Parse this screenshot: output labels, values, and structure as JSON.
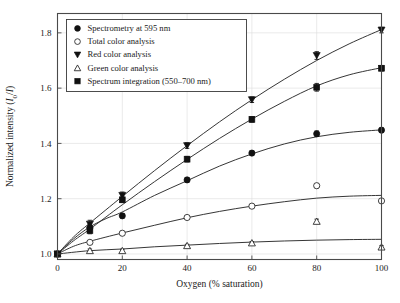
{
  "chart_data": {
    "type": "line",
    "title": "",
    "xlabel": "Oxygen (% saturation)",
    "ylabel": "Normalized intensity (I0/I)",
    "ylabel_parts": {
      "main": "Normalized intensity (",
      "i0": "I",
      "sub0": "0",
      "slash": "/",
      "i": "I",
      "close": ")"
    },
    "x": [
      0,
      10,
      20,
      40,
      60,
      80,
      100
    ],
    "xlim": [
      0,
      100
    ],
    "ylim": [
      0.98,
      1.87
    ],
    "xticks": [
      0,
      20,
      40,
      60,
      80,
      100
    ],
    "xtick_labels": [
      "0",
      "20",
      "40",
      "60",
      "80",
      "100"
    ],
    "yticks": [
      1.0,
      1.2,
      1.4,
      1.6,
      1.8
    ],
    "ytick_labels": [
      "1.0",
      "1.2",
      "1.4",
      "1.6",
      "1.8"
    ],
    "grid": true,
    "legend_position": "upper-left",
    "series": [
      {
        "name": "Spectrometry at 595 nm",
        "marker": "filled-circle",
        "values": [
          1.0,
          1.095,
          1.138,
          1.268,
          1.365,
          1.435,
          1.448
        ],
        "errors": [
          0.0,
          0.012,
          0.008,
          0.008,
          0.008,
          0.01,
          0.008
        ]
      },
      {
        "name": "Total color analysis",
        "marker": "open-circle",
        "values": [
          1.0,
          1.042,
          1.075,
          1.132,
          1.173,
          1.247,
          1.192
        ],
        "errors": [
          0.0,
          0.006,
          0.006,
          0.006,
          0.006,
          0.008,
          0.006
        ]
      },
      {
        "name": "Red color analysis",
        "marker": "filled-down-triangle",
        "values": [
          1.0,
          1.108,
          1.212,
          1.392,
          1.558,
          1.718,
          1.81
        ],
        "errors": [
          0.0,
          0.014,
          0.012,
          0.01,
          0.01,
          0.014,
          0.01
        ]
      },
      {
        "name": "Green color analysis",
        "marker": "open-up-triangle",
        "values": [
          1.0,
          1.012,
          1.012,
          1.03,
          1.04,
          1.118,
          1.025
        ],
        "errors": [
          0.0,
          0.006,
          0.005,
          0.005,
          0.005,
          0.008,
          0.005
        ]
      },
      {
        "name": "Spectrum integration (550–700 nm)",
        "marker": "filled-square",
        "values": [
          1.0,
          1.085,
          1.196,
          1.343,
          1.487,
          1.603,
          1.672
        ],
        "errors": [
          0.0,
          0.012,
          0.01,
          0.01,
          0.01,
          0.014,
          0.01
        ]
      }
    ],
    "fit_curves": [
      {
        "name": "Spectrometry at 595 nm",
        "points": [
          [
            0,
            1.0
          ],
          [
            5,
            1.055
          ],
          [
            10,
            1.098
          ],
          [
            15,
            1.128
          ],
          [
            20,
            1.152
          ],
          [
            30,
            1.212
          ],
          [
            40,
            1.265
          ],
          [
            50,
            1.318
          ],
          [
            60,
            1.362
          ],
          [
            70,
            1.398
          ],
          [
            80,
            1.424
          ],
          [
            90,
            1.44
          ],
          [
            100,
            1.449
          ]
        ]
      },
      {
        "name": "Total color analysis",
        "points": [
          [
            0,
            1.0
          ],
          [
            5,
            1.028
          ],
          [
            10,
            1.046
          ],
          [
            20,
            1.076
          ],
          [
            30,
            1.104
          ],
          [
            40,
            1.131
          ],
          [
            50,
            1.154
          ],
          [
            60,
            1.173
          ],
          [
            70,
            1.189
          ],
          [
            80,
            1.202
          ],
          [
            90,
            1.209
          ],
          [
            100,
            1.212
          ]
        ]
      },
      {
        "name": "Red color analysis",
        "points": [
          [
            0,
            1.0
          ],
          [
            5,
            1.062
          ],
          [
            10,
            1.112
          ],
          [
            20,
            1.208
          ],
          [
            30,
            1.302
          ],
          [
            40,
            1.392
          ],
          [
            50,
            1.478
          ],
          [
            60,
            1.558
          ],
          [
            70,
            1.632
          ],
          [
            80,
            1.7
          ],
          [
            90,
            1.76
          ],
          [
            100,
            1.812
          ]
        ]
      },
      {
        "name": "Green color analysis",
        "points": [
          [
            0,
            1.0
          ],
          [
            10,
            1.012
          ],
          [
            20,
            1.018
          ],
          [
            30,
            1.026
          ],
          [
            40,
            1.032
          ],
          [
            50,
            1.038
          ],
          [
            60,
            1.043
          ],
          [
            70,
            1.047
          ],
          [
            80,
            1.05
          ],
          [
            90,
            1.052
          ],
          [
            100,
            1.053
          ]
        ]
      },
      {
        "name": "Spectrum integration (550–700 nm)",
        "points": [
          [
            0,
            1.0
          ],
          [
            5,
            1.048
          ],
          [
            10,
            1.09
          ],
          [
            20,
            1.178
          ],
          [
            30,
            1.262
          ],
          [
            40,
            1.342
          ],
          [
            50,
            1.418
          ],
          [
            60,
            1.488
          ],
          [
            70,
            1.552
          ],
          [
            80,
            1.608
          ],
          [
            90,
            1.648
          ],
          [
            100,
            1.674
          ]
        ]
      }
    ],
    "legend_entries": [
      {
        "label": "Spectrometry at 595 nm",
        "marker": "filled-circle"
      },
      {
        "label": "Total color analysis",
        "marker": "open-circle"
      },
      {
        "label": "Red color analysis",
        "marker": "filled-down-triangle"
      },
      {
        "label": "Green color analysis",
        "marker": "open-up-triangle"
      },
      {
        "label": "Spectrum integration (550–700 nm)",
        "marker": "filled-square"
      }
    ],
    "colors": {
      "line": "#2b2b2b",
      "marker_filled": "#111111",
      "marker_open_fill": "#ffffff",
      "frame": "#4a4a4a",
      "grid": "#dcdcdc"
    }
  }
}
